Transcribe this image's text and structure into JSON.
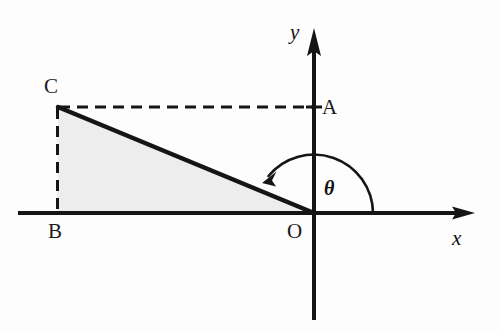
{
  "figure": {
    "background_color": "#fdfdfd",
    "stroke_color": "#151515",
    "shade_color": "#ededed"
  },
  "axes": {
    "x_axis": {
      "label": "x",
      "icon": "arrow-right-icon",
      "start_px": [
        18,
        213
      ],
      "end_px": [
        475,
        213
      ]
    },
    "y_axis": {
      "label": "y",
      "icon": "arrow-up-icon",
      "start_px": [
        314,
        320
      ],
      "end_px": [
        314,
        28
      ]
    },
    "origin_px": [
      314,
      213
    ]
  },
  "points": [
    {
      "name": "C",
      "label": "C",
      "px": [
        58,
        107
      ]
    },
    {
      "name": "A",
      "label": "A",
      "px": [
        314,
        107
      ]
    },
    {
      "name": "B",
      "label": "B",
      "px": [
        57,
        213
      ]
    },
    {
      "name": "O",
      "label": "O",
      "px": [
        314,
        213
      ]
    }
  ],
  "angle": {
    "label": "θ",
    "vertex": "O",
    "from_ray": "positive x-axis",
    "to_ray": "ray OC",
    "arc_radius_px": 59,
    "start_deg": 0,
    "end_deg": 202.5,
    "arrow_icon": "arc-arrow-icon"
  },
  "shapes": {
    "triangle": {
      "name": "triangle-BCO",
      "vertices": [
        "B",
        "C",
        "O"
      ],
      "filled": true,
      "fill": "#ededed"
    },
    "solid_segments": [
      {
        "name": "segment-CO",
        "from": "C",
        "to": "O"
      },
      {
        "name": "segment-BO",
        "from": "B",
        "to": "O"
      }
    ],
    "dashed_segments": [
      {
        "name": "segment-CA",
        "from": "C",
        "to": "A"
      },
      {
        "name": "segment-CB",
        "from": "C",
        "to": "B"
      }
    ]
  }
}
